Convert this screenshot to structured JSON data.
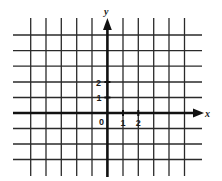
{
  "diagram": {
    "type": "coordinate-grid",
    "grid": {
      "vertical_lines_x": [
        30.7,
        46,
        61.3,
        76.7,
        92,
        123,
        138.3,
        153.7,
        169,
        184.5
      ],
      "horizontal_lines_y": [
        35,
        50.6,
        66.2,
        82,
        97.5,
        128.5,
        144,
        159.5
      ],
      "line_color": "#2a2a2a",
      "vertical_top": 18,
      "vertical_bottom": 176,
      "horizontal_left": 13,
      "horizontal_right": 202
    },
    "axes": {
      "origin_x": 107.4,
      "origin_y": 113,
      "x_axis_label": "x",
      "y_axis_label": "y",
      "origin_label": "0",
      "axis_color": "#111111"
    },
    "x_ticks": [
      {
        "value": 1,
        "label": "1"
      },
      {
        "value": 2,
        "label": "2"
      }
    ],
    "y_ticks": [
      {
        "value": 1,
        "label": "1"
      },
      {
        "value": 2,
        "label": "2"
      }
    ]
  },
  "labels": {
    "x_axis": "x",
    "y_axis": "y",
    "origin": "0",
    "x_tick_1": "1",
    "x_tick_2": "2",
    "y_tick_1": "1",
    "y_tick_2": "2"
  }
}
